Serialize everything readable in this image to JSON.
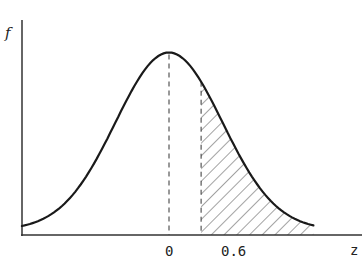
{
  "chart_data": {
    "type": "line",
    "title": "",
    "subtitle": "Standard normal density with shaded right-tail area beyond z = 0.6",
    "xlabel": "z",
    "ylabel": "f",
    "x_ticks": [
      {
        "value": 0,
        "label": "0"
      },
      {
        "value": 0.6,
        "label": "0.6"
      }
    ],
    "xlim": [
      -3.0,
      2.6
    ],
    "ylim": [
      0,
      0.45
    ],
    "grid": false,
    "legend": null,
    "series": [
      {
        "name": "f(z)",
        "kind": "normal-density",
        "mean": 0,
        "sd": 1,
        "x": [
          -3.0,
          -2.5,
          -2.0,
          -1.5,
          -1.0,
          -0.5,
          0,
          0.5,
          0.6,
          1.0,
          1.5,
          2.0,
          2.5
        ],
        "values": [
          0.004,
          0.018,
          0.054,
          0.13,
          0.242,
          0.352,
          0.399,
          0.352,
          0.333,
          0.242,
          0.13,
          0.054,
          0.018
        ]
      }
    ],
    "annotations": [
      {
        "type": "dashed-vertical",
        "x": 0,
        "note": "line from peak to axis"
      },
      {
        "type": "dashed-vertical",
        "x": 0.6,
        "note": "boundary of shaded region"
      },
      {
        "type": "hatched-area",
        "from": 0.6,
        "to": 2.5,
        "note": "P(Z > 0.6)"
      }
    ]
  },
  "labels": {
    "y_axis": "f",
    "x_axis": "z",
    "tick_zero": "0",
    "tick_cut": "0.6"
  },
  "colors": {
    "curve": "#1a1a1a",
    "axis": "#333333",
    "hatch": "#555555",
    "background": "#ffffff"
  }
}
